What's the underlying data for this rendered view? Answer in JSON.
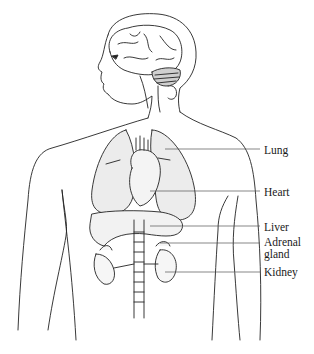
{
  "diagram": {
    "colors": {
      "line": "#222222",
      "organ_fill": "#ececec",
      "leader_line": "#555555",
      "background": "#ffffff"
    },
    "labels": [
      {
        "id": "lung",
        "text": "Lung",
        "x": 264,
        "y": 144,
        "leader": {
          "x1": 165,
          "x2": 260,
          "y": 149
        }
      },
      {
        "id": "heart",
        "text": "Heart",
        "x": 264,
        "y": 187,
        "leader": {
          "x1": 150,
          "x2": 260,
          "y": 191
        }
      },
      {
        "id": "liver",
        "text": "Liver",
        "x": 264,
        "y": 221,
        "leader": {
          "x1": 150,
          "x2": 260,
          "y": 226
        }
      },
      {
        "id": "adrenal-gland",
        "text": "Adrenal\ngland",
        "x": 264,
        "y": 235,
        "leader": {
          "x1": 160,
          "x2": 260,
          "y": 243
        }
      },
      {
        "id": "kidney",
        "text": "Kidney",
        "x": 264,
        "y": 264,
        "leader": {
          "x1": 165,
          "x2": 260,
          "y": 272
        }
      }
    ],
    "structures": [
      "Brain",
      "Cerebellum",
      "Lungs",
      "Heart",
      "Aorta",
      "Liver",
      "Adrenal glands",
      "Kidneys",
      "Spine"
    ]
  }
}
